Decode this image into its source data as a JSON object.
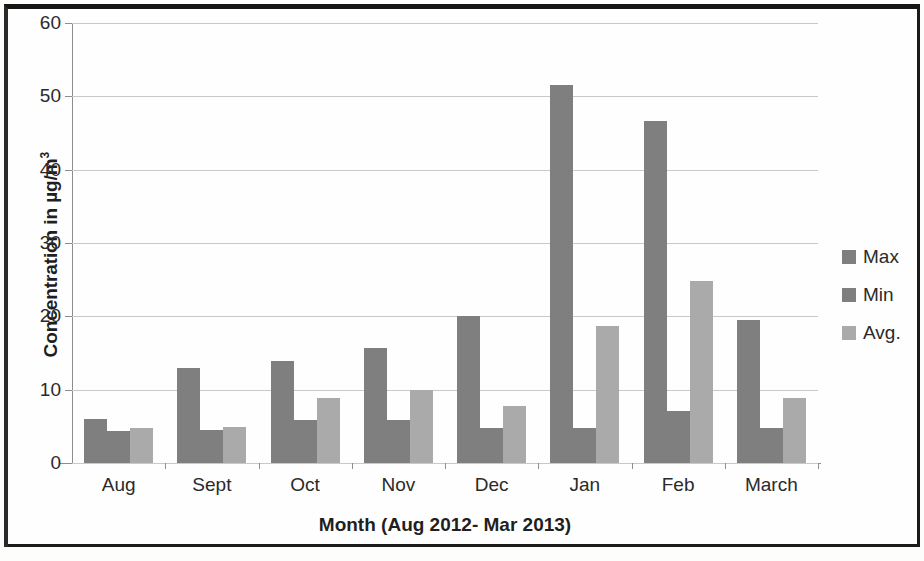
{
  "chart_data": {
    "type": "bar",
    "title": "",
    "xlabel": "Month (Aug 2012- Mar 2013)",
    "ylabel": "Concentration in µg/m³",
    "ylabel_text": "Concentration in µg/m",
    "ylabel_sup": "3",
    "categories": [
      "Aug",
      "Sept",
      "Oct",
      "Nov",
      "Dec",
      "Jan",
      "Feb",
      "March"
    ],
    "series": [
      {
        "name": "Max",
        "color": "#7f7f7f",
        "values": [
          6.0,
          12.9,
          13.9,
          15.7,
          20.0,
          51.5,
          46.7,
          19.5
        ]
      },
      {
        "name": "Min",
        "color": "#7f7f7f",
        "values": [
          4.3,
          4.5,
          5.9,
          5.9,
          4.8,
          4.8,
          7.1,
          4.8
        ]
      },
      {
        "name": "Avg.",
        "color": "#aaaaaa",
        "values": [
          4.8,
          4.9,
          8.9,
          10.0,
          7.8,
          18.7,
          24.8,
          8.8
        ]
      }
    ],
    "ylim": [
      0,
      60
    ],
    "yticks": [
      0,
      10,
      20,
      30,
      40,
      50,
      60
    ],
    "ytick_labels": [
      "0",
      "10",
      "20",
      "30",
      "40",
      "50",
      "60"
    ],
    "grid": true,
    "legend_position": "right",
    "legend_entries": [
      "Max",
      "Min",
      "Avg."
    ]
  }
}
